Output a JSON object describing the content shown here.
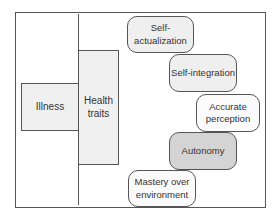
{
  "diagram": {
    "left": {
      "illness": "Illness",
      "health_traits": "Health traits"
    },
    "traits": [
      {
        "label": "Self-actualization",
        "shade": "#efefef"
      },
      {
        "label": "Self-integration",
        "shade": "#efefef"
      },
      {
        "label": "Accurate perception",
        "shade": "#fbfbfb"
      },
      {
        "label": "Autonomy",
        "shade": "#d4d4d4"
      },
      {
        "label": "Mastery over environment",
        "shade": "#fbfbfb"
      }
    ]
  }
}
